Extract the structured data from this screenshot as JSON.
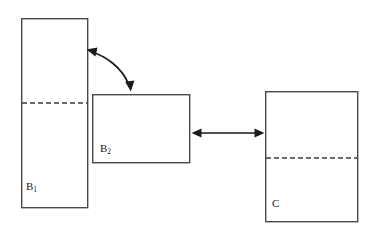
{
  "diagram": {
    "background_color": "#ffffff",
    "stroke_color": "#4a4a4a",
    "arrow_color": "#1a1a1a",
    "dash_color": "#3a3a3a",
    "boxes": [
      {
        "id": "b1",
        "label_main": "B",
        "label_sub": "1",
        "x": 21,
        "y": 18,
        "width": 67,
        "height": 190,
        "divider_y": 103,
        "has_dashed_divider": true
      },
      {
        "id": "b2",
        "label_main": "B",
        "label_sub": "2",
        "x": 92,
        "y": 94,
        "width": 98,
        "height": 69,
        "divider_y": null,
        "has_dashed_divider": false
      },
      {
        "id": "c",
        "label_main": "C",
        "label_sub": "",
        "x": 265,
        "y": 91,
        "width": 93,
        "height": 131,
        "divider_y": 158,
        "has_dashed_divider": true
      }
    ],
    "connectors": [
      {
        "id": "curved-b1-b2",
        "type": "curve",
        "style": "double-headed",
        "from": "b1",
        "to": "b2",
        "path": "M 90 51 C 104 55, 122 66, 130 86"
      },
      {
        "id": "straight-b2-c",
        "type": "line",
        "style": "double-headed",
        "from": "b2",
        "to": "c",
        "x1": 196,
        "y1": 133,
        "x2": 260,
        "y2": 133
      }
    ]
  }
}
